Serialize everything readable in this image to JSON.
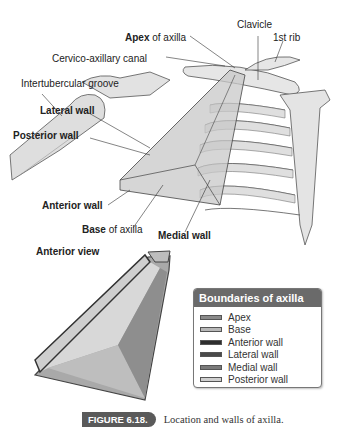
{
  "labels": {
    "clavicle": "Clavicle",
    "apex_bold": "Apex",
    "apex_rest": " of axilla",
    "first_rib": "1st rib",
    "cervico_axillary_canal": "Cervico-axillary canal",
    "intertubercular_groove": "Intertubercular groove",
    "lateral_wall": "Lateral wall",
    "posterior_wall": "Posterior wall",
    "anterior_wall": "Anterior wall",
    "base_bold": "Base",
    "base_rest": " of axilla",
    "medial_wall": "Medial wall",
    "anterior_view": "Anterior view"
  },
  "legend": {
    "title": "Boundaries of axilla",
    "items": [
      {
        "label": "Apex",
        "color": "#8a8a8a"
      },
      {
        "label": "Base",
        "color": "#b8b8b8"
      },
      {
        "label": "Anterior wall",
        "color": "#2e2e2e"
      },
      {
        "label": "Lateral wall",
        "color": "#4a4a4a"
      },
      {
        "label": "Medial wall",
        "color": "#7a7a7a"
      },
      {
        "label": "Posterior wall",
        "color": "#cfcfcf"
      }
    ]
  },
  "caption": {
    "figure": "FIGURE 6.18.",
    "text": "Location and walls of axilla."
  }
}
